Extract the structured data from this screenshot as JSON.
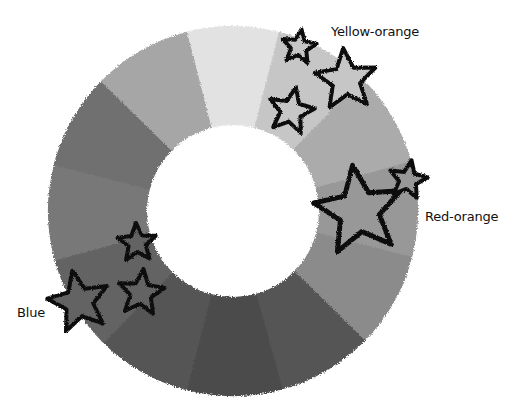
{
  "diagram": {
    "center": [
      233,
      211
    ],
    "outer_radius": 185,
    "inner_radius": 86,
    "segments": [
      {
        "name": "yellow",
        "angle_center": 0,
        "gray": "#e2e2e2"
      },
      {
        "name": "yellow-orange",
        "angle_center": 30,
        "gray": "#c6c6c6"
      },
      {
        "name": "orange",
        "angle_center": 60,
        "gray": "#ababab"
      },
      {
        "name": "red-orange",
        "angle_center": 90,
        "gray": "#989898"
      },
      {
        "name": "red",
        "angle_center": 120,
        "gray": "#8b8b8b"
      },
      {
        "name": "red-violet",
        "angle_center": 150,
        "gray": "#545454"
      },
      {
        "name": "violet",
        "angle_center": 180,
        "gray": "#4c4c4c"
      },
      {
        "name": "blue-violet",
        "angle_center": 210,
        "gray": "#545454"
      },
      {
        "name": "blue",
        "angle_center": 240,
        "gray": "#636363"
      },
      {
        "name": "blue-green",
        "angle_center": 270,
        "gray": "#787878"
      },
      {
        "name": "green",
        "angle_center": 300,
        "gray": "#6f6f6f"
      },
      {
        "name": "yellow-green",
        "angle_center": 330,
        "gray": "#a6a6a6"
      }
    ],
    "stars": [
      {
        "group": "yellow-orange",
        "cx": 299,
        "cy": 47,
        "r": 18,
        "fill": "#c6c6c6"
      },
      {
        "group": "yellow-orange",
        "cx": 346,
        "cy": 80,
        "r": 32,
        "fill": "#c6c6c6"
      },
      {
        "group": "yellow-orange",
        "cx": 291,
        "cy": 111,
        "r": 24,
        "fill": "#c6c6c6"
      },
      {
        "group": "red-orange",
        "cx": 359,
        "cy": 211,
        "r": 46,
        "fill": "#989898"
      },
      {
        "group": "red-orange",
        "cx": 408,
        "cy": 180,
        "r": 20,
        "fill": "#989898"
      },
      {
        "group": "blue",
        "cx": 137,
        "cy": 243,
        "r": 20,
        "fill": "#636363"
      },
      {
        "group": "blue",
        "cx": 141,
        "cy": 293,
        "r": 24,
        "fill": "#636363"
      },
      {
        "group": "blue",
        "cx": 79,
        "cy": 302,
        "r": 32,
        "fill": "#636363"
      }
    ],
    "labels": [
      {
        "text": "Yellow-orange",
        "x": 331,
        "y": 24
      },
      {
        "text": "Red-orange",
        "x": 425,
        "y": 209
      },
      {
        "text": "Blue",
        "x": 17,
        "y": 305
      }
    ]
  }
}
